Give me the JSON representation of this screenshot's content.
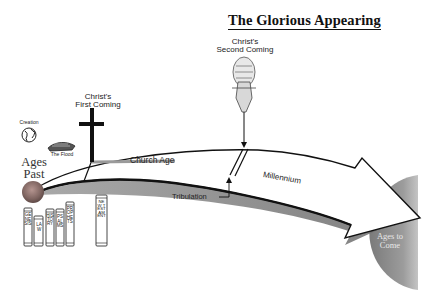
{
  "title": "The Glorious Appearing",
  "labels": {
    "second_coming": [
      "Christ's",
      "Second Coming"
    ],
    "first_coming": [
      "Christ's",
      "First Coming"
    ],
    "creation": "Creation",
    "flood": "The Flood",
    "ages_past": [
      "Ages",
      "Past"
    ],
    "church_age": "Church Age",
    "tribulation": "Tribulation",
    "millennium": "Millennium",
    "ages_to_come": [
      "Ages to",
      "Come"
    ]
  },
  "books": [
    {
      "label": "GENESIS"
    },
    {
      "label": "LAW"
    },
    {
      "label": "HISTORY"
    },
    {
      "label": "PSALMS"
    },
    {
      "label": "PROPHETS"
    },
    {
      "label": "NEW TESTAMENT"
    }
  ],
  "colors": {
    "ink": "#111111",
    "arrow_fill": "#ffffff",
    "arrow_shadow": "#6e6e6e",
    "ages_to_come": "#8a8a8a",
    "ages_past_sphere": "#8f6e6a"
  }
}
